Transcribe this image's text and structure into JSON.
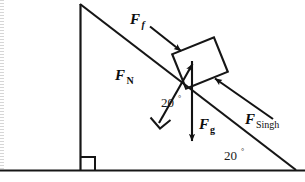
{
  "figure": {
    "type": "physics-force-diagram",
    "background_color": "#ffffff",
    "line_color": "#161616"
  },
  "incline": {
    "angle_label": "20",
    "degree_symbol": "°",
    "base_angle_label": "20",
    "block_angle_label": "20",
    "apex_x": 80,
    "apex_y": 4,
    "base_left_x": 80,
    "base_right_x": 295,
    "ground_y": 170
  },
  "forces": [
    {
      "id": "friction",
      "symbol": "F",
      "subscript": "f",
      "subscript_style": "italic",
      "label_x": 132,
      "label_y": 22,
      "direction": "down-the-incline toward block",
      "tail": [
        152,
        28
      ],
      "head": [
        182,
        52
      ]
    },
    {
      "id": "normal",
      "symbol": "F",
      "subscript": "N",
      "subscript_style": "roman",
      "label_x": 117,
      "label_y": 78,
      "direction": "perpendicular to incline surface, away from surface",
      "tail": [
        160,
        122
      ],
      "head": [
        193,
        63
      ]
    },
    {
      "id": "gravity",
      "symbol": "F",
      "subscript": "g",
      "subscript_style": "roman",
      "label_x": 200,
      "label_y": 128,
      "direction": "straight down",
      "tail": [
        192,
        62
      ],
      "head": [
        192,
        142
      ]
    },
    {
      "id": "applied-singh",
      "symbol": "F",
      "subscript": "Singh",
      "subscript_style": "name",
      "label_x": 246,
      "label_y": 122,
      "direction": "up the incline toward block",
      "tail": [
        272,
        118
      ],
      "head": [
        214,
        78
      ]
    }
  ],
  "angle_markers": [
    {
      "id": "block-incline-angle",
      "value": "20",
      "degree": "°",
      "x": 163,
      "y": 105
    },
    {
      "id": "base-incline-angle",
      "value": "20",
      "degree": "°",
      "x": 226,
      "y": 158
    }
  ],
  "right_angles": [
    {
      "id": "normal-surface-right-angle",
      "x": 157,
      "y": 118
    },
    {
      "id": "triangle-base-right-angle",
      "x": 82,
      "y": 158
    }
  ],
  "block": {
    "id": "block-on-incline",
    "rotation_deg": -22,
    "center_x": 200,
    "center_y": 63,
    "width": 44,
    "height": 36
  }
}
